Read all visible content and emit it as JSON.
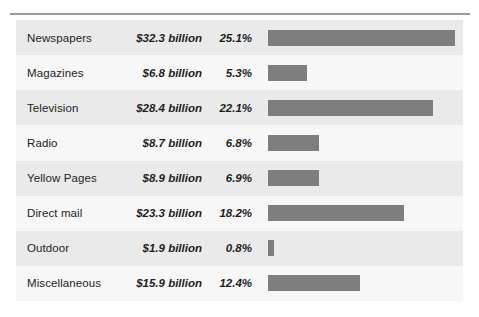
{
  "chart_data": {
    "type": "bar",
    "title": "",
    "subtitle": "",
    "xlabel": "",
    "ylabel": "",
    "orientation": "horizontal",
    "grid": false,
    "legend": false,
    "axis_visible": false,
    "xlim": [
      0,
      25.1
    ],
    "categories": [
      "Newspapers",
      "Magazines",
      "Television",
      "Radio",
      "Yellow Pages",
      "Direct mail",
      "Outdoor",
      "Miscellaneous"
    ],
    "values": [
      25.1,
      5.3,
      22.1,
      6.8,
      6.9,
      18.2,
      0.8,
      12.4
    ],
    "value_unit": "percent",
    "series": [
      {
        "name": "Share of spending",
        "values": [
          25.1,
          5.3,
          22.1,
          6.8,
          6.9,
          18.2,
          0.8,
          12.4
        ]
      },
      {
        "name": "Spending (billions USD)",
        "values": [
          32.3,
          6.8,
          28.4,
          8.7,
          8.9,
          23.3,
          1.9,
          15.9
        ]
      }
    ],
    "bar_color": "#7e7e7e",
    "row_band_colors": [
      "#eaeaea",
      "#f7f7f7"
    ],
    "rows": [
      {
        "label": "Newspapers",
        "amount": "$32.3 billion",
        "percent": "25.1%",
        "value": 25.1
      },
      {
        "label": "Magazines",
        "amount": "$6.8 billion",
        "percent": "5.3%",
        "value": 5.3
      },
      {
        "label": "Television",
        "amount": "$28.4 billion",
        "percent": "22.1%",
        "value": 22.1
      },
      {
        "label": "Radio",
        "amount": "$8.7 billion",
        "percent": "6.8%",
        "value": 6.8
      },
      {
        "label": "Yellow Pages",
        "amount": "$8.9 billion",
        "percent": "6.9%",
        "value": 6.9
      },
      {
        "label": "Direct mail",
        "amount": "$23.3 billion",
        "percent": "18.2%",
        "value": 18.2
      },
      {
        "label": "Outdoor",
        "amount": "$1.9 billion",
        "percent": "0.8%",
        "value": 0.8
      },
      {
        "label": "Miscellaneous",
        "amount": "$15.9 billion",
        "percent": "12.4%",
        "value": 12.4
      }
    ]
  }
}
